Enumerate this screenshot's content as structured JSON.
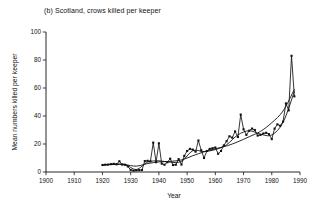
{
  "chart_data": {
    "type": "line",
    "title": "(b) Scotland, crows killed per keeper",
    "xlabel": "Year",
    "ylabel": "Mean numbers killed per keeper",
    "xlim": [
      1900,
      1990
    ],
    "ylim": [
      0,
      100
    ],
    "xticks": [
      1900,
      1910,
      1920,
      1930,
      1940,
      1950,
      1960,
      1970,
      1980,
      1990
    ],
    "yticks": [
      0,
      20,
      40,
      60,
      80,
      100
    ],
    "grid": false,
    "legend": "none",
    "marker": "filled-square",
    "series": [
      {
        "name": "Mean crows killed per keeper",
        "style": "line-with-markers",
        "x": [
          1920,
          1921,
          1922,
          1923,
          1924,
          1925,
          1926,
          1927,
          1928,
          1929,
          1930,
          1931,
          1932,
          1933,
          1934,
          1935,
          1936,
          1937,
          1938,
          1939,
          1940,
          1941,
          1942,
          1943,
          1944,
          1945,
          1946,
          1947,
          1948,
          1949,
          1950,
          1951,
          1952,
          1953,
          1954,
          1955,
          1956,
          1957,
          1958,
          1959,
          1960,
          1961,
          1962,
          1963,
          1964,
          1965,
          1966,
          1967,
          1968,
          1969,
          1970,
          1971,
          1972,
          1973,
          1974,
          1975,
          1976,
          1977,
          1978,
          1979,
          1980,
          1981,
          1982,
          1983,
          1984,
          1985,
          1986,
          1987,
          1988
        ],
        "y": [
          5.0,
          5.2,
          5.3,
          5.6,
          5.8,
          5.5,
          7.7,
          5.3,
          5.2,
          4.0,
          1.5,
          1.0,
          1.2,
          1.3,
          1.4,
          7.8,
          8.0,
          7.6,
          21.0,
          7.0,
          20.5,
          6.0,
          5.2,
          7.0,
          9.5,
          5.0,
          5.2,
          9.2,
          5.3,
          11.5,
          15.0,
          16.5,
          16.0,
          14.5,
          22.5,
          15.5,
          10.0,
          15.0,
          16.5,
          17.0,
          17.5,
          13.0,
          15.0,
          19.0,
          22.0,
          25.5,
          24.5,
          29.0,
          25.0,
          41.0,
          30.5,
          26.5,
          29.5,
          31.0,
          30.0,
          26.0,
          26.5,
          27.5,
          28.0,
          27.0,
          23.5,
          31.0,
          34.0,
          33.0,
          36.0,
          49.0,
          44.0,
          83.0,
          54.0
        ]
      },
      {
        "name": "Fitted trend",
        "style": "smooth-curve",
        "x": [
          1920,
          1924,
          1928,
          1932,
          1936,
          1940,
          1944,
          1948,
          1952,
          1956,
          1960,
          1964,
          1968,
          1972,
          1976,
          1980,
          1984,
          1988
        ],
        "y": [
          5.0,
          5.4,
          5.2,
          4.2,
          6.0,
          7.2,
          7.6,
          8.6,
          11.6,
          14.4,
          16.6,
          18.6,
          21.6,
          25.2,
          29.0,
          35.2,
          43.6,
          59.0
        ]
      },
      {
        "name": "Smoothed running mean",
        "style": "smooth-curve",
        "x": [
          1920,
          1924,
          1928,
          1932,
          1936,
          1940,
          1944,
          1948,
          1952,
          1956,
          1960,
          1964,
          1968,
          1972,
          1976,
          1980,
          1984,
          1988
        ],
        "y": [
          5.0,
          5.6,
          5.4,
          1.8,
          7.0,
          8.0,
          7.0,
          7.6,
          15.2,
          14.6,
          16.0,
          19.5,
          26.5,
          29.5,
          27.0,
          26.5,
          35.5,
          57.5
        ]
      }
    ]
  }
}
